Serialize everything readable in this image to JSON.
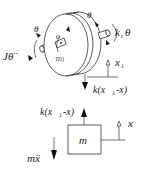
{
  "diagram": {
    "type": "free-body diagram",
    "labels": {
      "inertia_torque": "Jθ̈",
      "theta_left": "θ",
      "theta_right": "θ",
      "center": "o",
      "torque": "T(t)",
      "spring_torque": "k",
      "spring_torque_sub": "t",
      "spring_torque_theta": "θ",
      "x1": "x",
      "x1_sub": "1",
      "force_down": "k(x",
      "force_down_sub": "1",
      "force_down_tail": "-x)",
      "force_up": "k(x",
      "force_up_sub": "1",
      "force_up_tail": "-x)",
      "mass": "m",
      "x": "x",
      "inertia_force": "mẍ"
    },
    "colors": {
      "line": "#333333",
      "background": "#ffffff"
    }
  }
}
